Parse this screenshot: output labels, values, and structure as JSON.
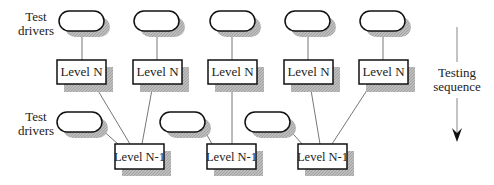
{
  "diagram": {
    "left_labels": {
      "top": [
        "Test",
        "drivers"
      ],
      "bottom": [
        "Test",
        "drivers"
      ]
    },
    "level_n_label": "Level N",
    "level_n1_label": "Level N-1",
    "sequence_label": [
      "Testing",
      "sequence"
    ],
    "colors": {
      "stroke": "#111111",
      "shadow": "#b0b0b0",
      "line": "#777777"
    }
  }
}
